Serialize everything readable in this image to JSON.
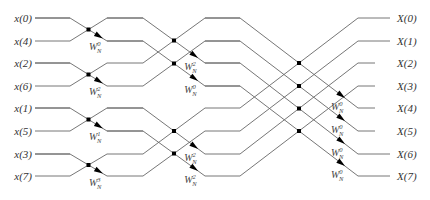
{
  "diagram": {
    "inputs": [
      "x(0)",
      "x(4)",
      "x(2)",
      "x(6)",
      "x(1)",
      "x(5)",
      "x(3)",
      "x(7)"
    ],
    "outputs": [
      "X(0)",
      "X(1)",
      "X(2)",
      "X(3)",
      "X(4)",
      "X(5)",
      "X(6)",
      "X(7)"
    ],
    "stage1_twiddles": [
      {
        "base": "W",
        "sub": "N",
        "sup": "0"
      },
      {
        "base": "W",
        "sub": "N",
        "sup": "2"
      },
      {
        "base": "W",
        "sub": "N",
        "sup": "1"
      },
      {
        "base": "W",
        "sub": "N",
        "sup": "3"
      }
    ],
    "stage2_twiddles": [
      {
        "base": "W",
        "sub": "N",
        "sup": "2"
      },
      {
        "base": "W",
        "sub": "N",
        "sup": "0"
      },
      {
        "base": "W",
        "sub": "N",
        "sup": "2"
      },
      {
        "base": "W",
        "sub": "N",
        "sup": "2"
      }
    ],
    "stage3_twiddles": [
      {
        "base": "W",
        "sub": "N",
        "sup": "0"
      },
      {
        "base": "W",
        "sub": "N",
        "sup": "0"
      },
      {
        "base": "W",
        "sub": "N",
        "sup": "0"
      },
      {
        "base": "W",
        "sub": "N",
        "sup": "0"
      }
    ],
    "colors": {
      "wire": "#666666",
      "node": "#000000",
      "text": "#333333"
    }
  }
}
